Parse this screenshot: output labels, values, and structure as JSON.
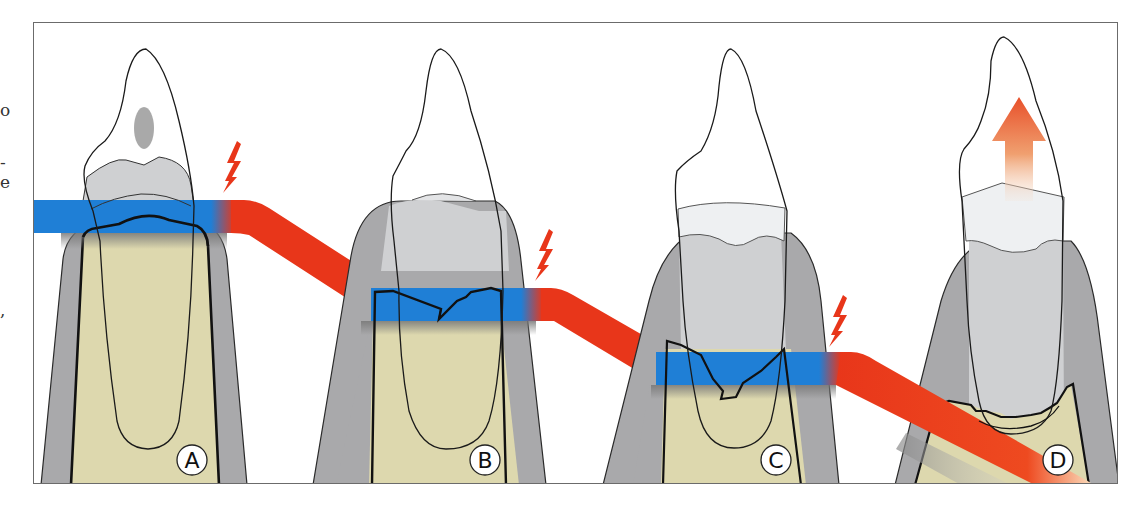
{
  "figure": {
    "title": "",
    "type": "dental diagram: progressive periodontal attachment / bone loss with tooth extrusion",
    "colors": {
      "tissue_band": "#1f7fd6",
      "trauma_band": "#e8361a",
      "bone": "#ddd8ae",
      "gingiva": "#a9a9ab",
      "root_gray": "#cfd0d2",
      "enamel_light": "#eef0f2",
      "outline": "#1a1a1a",
      "lightning": "#e8361a",
      "arrow": "#e8502a",
      "frame": "#6b6b6b"
    },
    "panels": [
      {
        "label": "A",
        "has_lightning": true,
        "has_cavity_dot": true
      },
      {
        "label": "B",
        "has_lightning": true
      },
      {
        "label": "C",
        "has_lightning": true
      },
      {
        "label": "D",
        "has_extrusion_arrow": true
      }
    ],
    "edge_text_fragments": [
      "o",
      "-",
      "e",
      ","
    ]
  }
}
